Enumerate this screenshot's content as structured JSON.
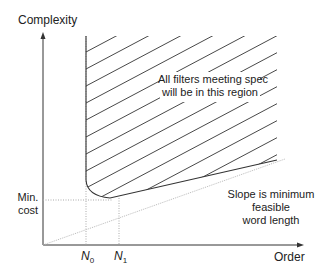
{
  "diagram": {
    "y_axis_label": "Complexity",
    "x_axis_label": "Order",
    "min_cost_label_line1": "Min.",
    "min_cost_label_line2": "cost",
    "n0_label": "N",
    "n0_sub": "0",
    "n1_label": "N",
    "n1_sub": "1",
    "region_label_line1": "All filters meeting spec",
    "region_label_line2": "will be in this region",
    "slope_label_line1": "Slope is minimum",
    "slope_label_line2": "feasible",
    "slope_label_line3": "word length",
    "colors": {
      "axis": "#333333",
      "curve": "#333333",
      "dotted": "#999999",
      "text": "#222222"
    }
  }
}
